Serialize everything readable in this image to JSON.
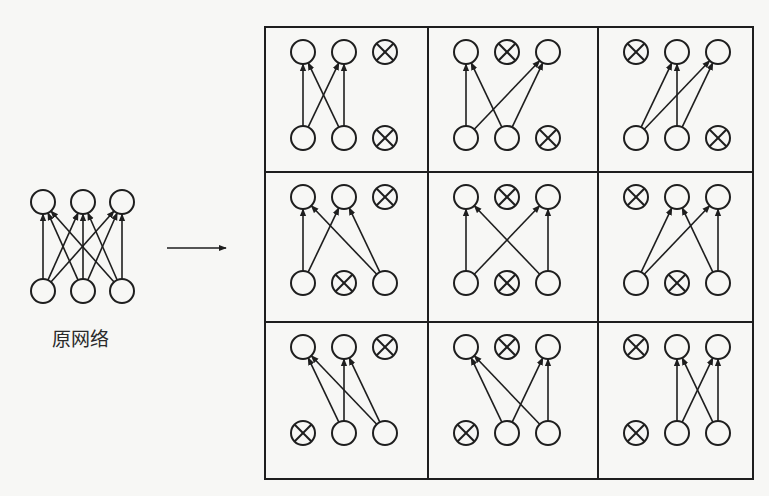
{
  "colors": {
    "stroke": "#1e1e1e",
    "background": "#f7f7f5"
  },
  "original": {
    "label": "原网络",
    "top_nodes": [
      [
        43,
        202
      ],
      [
        83,
        202
      ],
      [
        122,
        202
      ]
    ],
    "bottom_nodes": [
      [
        43,
        291
      ],
      [
        83,
        291
      ],
      [
        122,
        291
      ]
    ],
    "node_radius": 12,
    "edges": "fully-connected"
  },
  "arrow": {
    "x1": 167,
    "x2": 226,
    "y": 248
  },
  "grid": {
    "x": [
      265,
      428,
      598,
      753
    ],
    "y": [
      27,
      172,
      322,
      479
    ],
    "node_offsets_x": [
      38,
      79,
      120
    ],
    "node_offsets_y_top": 25,
    "node_offsets_y_bottom": 111,
    "cells": [
      {
        "dropped_top": 2,
        "dropped_bottom": 2
      },
      {
        "dropped_top": 1,
        "dropped_bottom": 2
      },
      {
        "dropped_top": 0,
        "dropped_bottom": 2
      },
      {
        "dropped_top": 2,
        "dropped_bottom": 1
      },
      {
        "dropped_top": 1,
        "dropped_bottom": 1
      },
      {
        "dropped_top": 0,
        "dropped_bottom": 1
      },
      {
        "dropped_top": 2,
        "dropped_bottom": 0
      },
      {
        "dropped_top": 1,
        "dropped_bottom": 0
      },
      {
        "dropped_top": 0,
        "dropped_bottom": 0
      }
    ]
  }
}
